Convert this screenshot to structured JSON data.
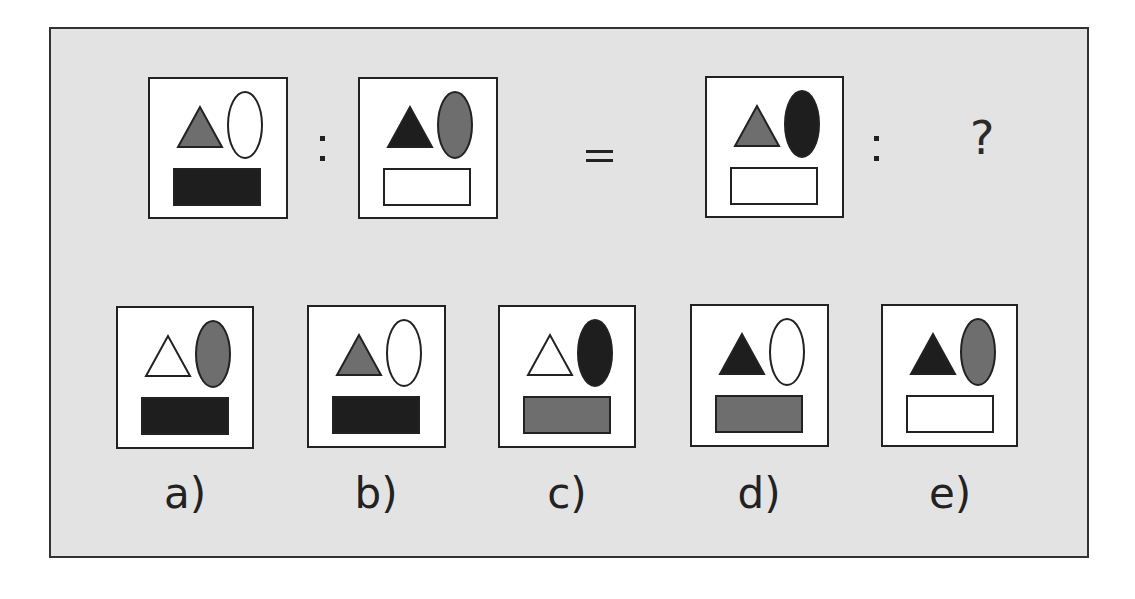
{
  "puzzle": {
    "question_mark": "?",
    "colors": {
      "frame_bg": "#e3e3e3",
      "black": "#1e1e1e",
      "gray": "#6e6e6e",
      "white": "#ffffff",
      "stroke": "#222222"
    },
    "analogy": [
      {
        "id": "A",
        "triangle": "gray",
        "ellipse": "white",
        "rect": "black"
      },
      {
        "id": "B",
        "triangle": "black",
        "ellipse": "gray",
        "rect": "white"
      },
      {
        "id": "C",
        "triangle": "gray",
        "ellipse": "black",
        "rect": "white"
      }
    ],
    "options": [
      {
        "label": "a)",
        "triangle": "white",
        "ellipse": "gray",
        "rect": "black"
      },
      {
        "label": "b)",
        "triangle": "gray",
        "ellipse": "white",
        "rect": "black"
      },
      {
        "label": "c)",
        "triangle": "white",
        "ellipse": "black",
        "rect": "gray"
      },
      {
        "label": "d)",
        "triangle": "black",
        "ellipse": "white",
        "rect": "gray"
      },
      {
        "label": "e)",
        "triangle": "black",
        "ellipse": "gray",
        "rect": "white"
      }
    ]
  }
}
